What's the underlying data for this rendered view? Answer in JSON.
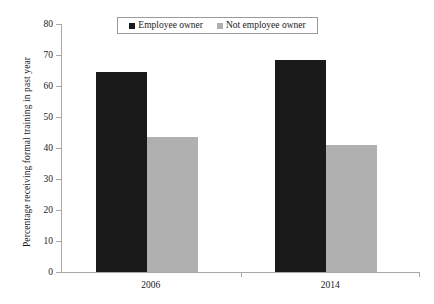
{
  "chart_data": {
    "type": "bar",
    "title": "",
    "xlabel": "",
    "ylabel": "Percentage receiving formal training in past year",
    "categories": [
      "2006",
      "2014"
    ],
    "series": [
      {
        "name": "Employee owner",
        "values": [
          64.5,
          68.5
        ],
        "color": "#1a1a1a"
      },
      {
        "name": "Not employee owner",
        "values": [
          43.5,
          41.0
        ],
        "color": "#b0b0b0"
      }
    ],
    "ylim": [
      0,
      80
    ],
    "yticks": [
      0,
      10,
      20,
      30,
      40,
      50,
      60,
      70,
      80
    ],
    "ytick_labels": [
      "0",
      "10",
      "20",
      "30",
      "40",
      "50",
      "60",
      "70",
      "80"
    ],
    "grid": false,
    "legend_position": "top-center"
  },
  "legend": {
    "entries": [
      {
        "label": "Employee owner",
        "color": "#1a1a1a"
      },
      {
        "label": "Not employee owner",
        "color": "#b0b0b0"
      }
    ]
  }
}
